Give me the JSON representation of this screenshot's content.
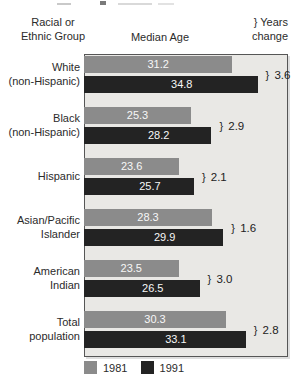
{
  "header": {
    "racial_ethnic_line1": "Racial or",
    "racial_ethnic_line2": "Ethnic Group",
    "median_age": "Median Age",
    "years_change_line1": "} Years",
    "years_change_line2": "change"
  },
  "legend": {
    "items": [
      {
        "label": "1981",
        "color": "#8b8b8b"
      },
      {
        "label": "1991",
        "color": "#232323"
      }
    ],
    "position": "bottom"
  },
  "colors": {
    "bar_1981": "#8b8b8b",
    "bar_1991": "#232323",
    "panel_background": "#e9e8e5",
    "panel_border": "#565656",
    "value_text": "#f7f7f7"
  },
  "chart_data": {
    "type": "bar",
    "orientation": "horizontal",
    "value_axis_label": "Median Age",
    "xlim": [
      10,
      40
    ],
    "grid": false,
    "legend_position": "bottom",
    "categories": [
      "White (non-Hispanic)",
      "Black (non-Hispanic)",
      "Hispanic",
      "Asian/Pacific Islander",
      "American Indian",
      "Total population"
    ],
    "category_lines": [
      [
        "White",
        "(non-Hispanic)"
      ],
      [
        "Black",
        "(non-Hispanic)"
      ],
      [
        "Hispanic"
      ],
      [
        "Asian/Pacific",
        "Islander"
      ],
      [
        "American",
        "Indian"
      ],
      [
        "Total",
        "population"
      ]
    ],
    "series": [
      {
        "name": "1981",
        "color": "#8b8b8b",
        "values": [
          31.2,
          25.3,
          23.6,
          28.3,
          23.5,
          30.3
        ]
      },
      {
        "name": "1991",
        "color": "#232323",
        "values": [
          34.8,
          28.2,
          25.7,
          29.9,
          26.5,
          33.1
        ]
      }
    ],
    "years_change_brace": "}",
    "years_change_labels": [
      "3.6",
      "2.9",
      "2.1",
      "1.6",
      "3.0",
      "2.8"
    ]
  }
}
